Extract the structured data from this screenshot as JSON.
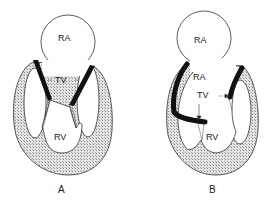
{
  "panels": [
    {
      "id": "A",
      "caption": "A",
      "labels": {
        "atrium": "RA",
        "valve": "TV",
        "ventricle": "RV"
      }
    },
    {
      "id": "B",
      "caption": "B",
      "labels": {
        "atrium_upper": "RA",
        "atrium_lower": "RA",
        "valve": "TV",
        "ventricle": "RV"
      }
    }
  ],
  "colors": {
    "outline": "#333333",
    "leaflet": "#111111",
    "myocardium": "#cfcfcf",
    "background": "#ffffff"
  }
}
